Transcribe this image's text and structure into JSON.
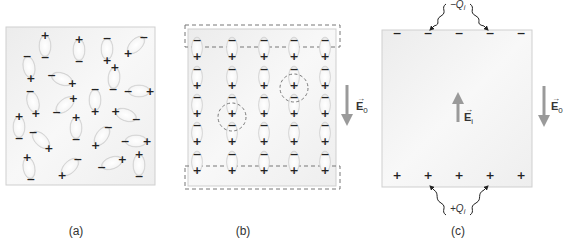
{
  "panels": {
    "a": {
      "caption": "(a)",
      "dipoles": [
        {
          "x": 45,
          "y": 46,
          "angle": 90,
          "left": "+",
          "right": "−"
        },
        {
          "x": 79,
          "y": 50,
          "angle": -90,
          "left": "−",
          "right": "+"
        },
        {
          "x": 107,
          "y": 49,
          "angle": -90,
          "left": "+",
          "right": "−"
        },
        {
          "x": 136,
          "y": 45,
          "angle": -45,
          "left": "+",
          "right": "−"
        },
        {
          "x": 29,
          "y": 67,
          "angle": -100,
          "left": "+",
          "right": "−"
        },
        {
          "x": 62,
          "y": 79,
          "angle": 20,
          "left": "−",
          "right": "+"
        },
        {
          "x": 114,
          "y": 78,
          "angle": 95,
          "left": "+",
          "right": "−"
        },
        {
          "x": 139,
          "y": 91,
          "angle": 0,
          "left": "−",
          "right": "+"
        },
        {
          "x": 33,
          "y": 102,
          "angle": 75,
          "left": "−",
          "right": "+"
        },
        {
          "x": 65,
          "y": 105,
          "angle": -40,
          "left": "−",
          "right": "+"
        },
        {
          "x": 95,
          "y": 100,
          "angle": -90,
          "left": "+",
          "right": "−"
        },
        {
          "x": 126,
          "y": 115,
          "angle": 20,
          "left": "+",
          "right": "−"
        },
        {
          "x": 19,
          "y": 127,
          "angle": 90,
          "left": "+",
          "right": "−"
        },
        {
          "x": 41,
          "y": 140,
          "angle": 45,
          "left": "−",
          "right": "+"
        },
        {
          "x": 76,
          "y": 128,
          "angle": 90,
          "left": "+",
          "right": "−"
        },
        {
          "x": 102,
          "y": 136,
          "angle": -55,
          "left": "+",
          "right": "−"
        },
        {
          "x": 136,
          "y": 141,
          "angle": 0,
          "left": "−",
          "right": "+"
        },
        {
          "x": 29,
          "y": 168,
          "angle": 80,
          "left": "+",
          "right": "−"
        },
        {
          "x": 70,
          "y": 167,
          "angle": -45,
          "left": "+",
          "right": "−"
        },
        {
          "x": 112,
          "y": 163,
          "angle": -20,
          "left": "−",
          "right": "+"
        },
        {
          "x": 139,
          "y": 165,
          "angle": 90,
          "left": "+",
          "right": "−"
        }
      ]
    },
    "b": {
      "caption": "(b)",
      "columns_x": [
        197,
        232,
        264,
        294,
        325
      ],
      "rows_neg_y": [
        41,
        70,
        98,
        126,
        155
      ],
      "circles": [
        {
          "cx": 232,
          "cy": 117,
          "r": 14
        },
        {
          "cx": 294,
          "cy": 88,
          "r": 14
        }
      ],
      "field_label": "E",
      "field_subscript": "0"
    },
    "c": {
      "caption": "(c)",
      "charge_x": [
        397,
        428,
        459,
        490,
        521
      ],
      "top_sign": "−",
      "bottom_sign": "+",
      "top_charge_label": "−Q",
      "top_charge_subscript": "i",
      "bottom_charge_label": "+Q",
      "bottom_charge_subscript": "i",
      "inner_field_label": "E",
      "inner_field_subscript": "i",
      "outer_field_label": "E",
      "outer_field_subscript": "0"
    }
  },
  "colors": {
    "panel_fill": "#f1f1f1",
    "panel_border": "#cfcfcf",
    "dashed": "#777777",
    "arrow": "#9a9a9a",
    "text": "#333333"
  }
}
